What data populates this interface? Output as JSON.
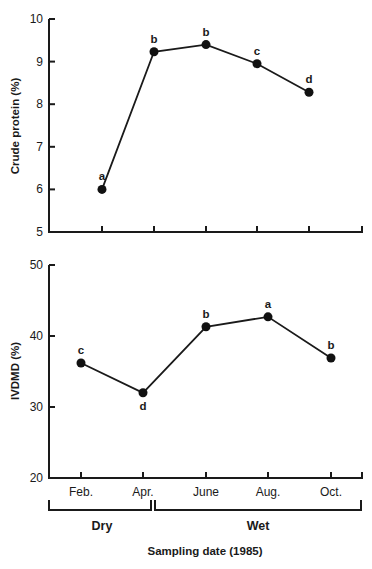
{
  "chart_data": [
    {
      "type": "line",
      "title": "",
      "xlabel": "",
      "ylabel": "Crude protein (%)",
      "categories": [
        "Feb.",
        "Apr.",
        "June",
        "Aug.",
        "Oct."
      ],
      "series": [
        {
          "name": "Crude protein",
          "values": [
            6.0,
            9.23,
            9.4,
            8.95,
            8.28
          ],
          "letters": [
            "a",
            "b",
            "b",
            "c",
            "d"
          ]
        }
      ],
      "ylim": [
        5,
        10
      ],
      "yticks": [
        "5",
        "6",
        "7",
        "8",
        "9",
        "10"
      ],
      "grid": false,
      "show_xtick_labels": false
    },
    {
      "type": "line",
      "title": "",
      "xlabel": "Sampling date (1985)",
      "ylabel": "IVDMD (%)",
      "categories": [
        "Feb.",
        "Apr.",
        "June",
        "Aug.",
        "Oct."
      ],
      "series": [
        {
          "name": "IVDMD",
          "values": [
            36.2,
            32.0,
            41.3,
            42.7,
            36.9
          ],
          "letters": [
            "c",
            "d",
            "b",
            "a",
            "b"
          ]
        }
      ],
      "ylim": [
        20,
        50
      ],
      "yticks": [
        "20",
        "30",
        "40",
        "50"
      ],
      "grid": false,
      "show_xtick_labels": true,
      "seasons": [
        {
          "label": "Dry",
          "from": "Feb.",
          "to": "Apr."
        },
        {
          "label": "Wet",
          "from": "June",
          "to": "Oct."
        }
      ]
    }
  ]
}
